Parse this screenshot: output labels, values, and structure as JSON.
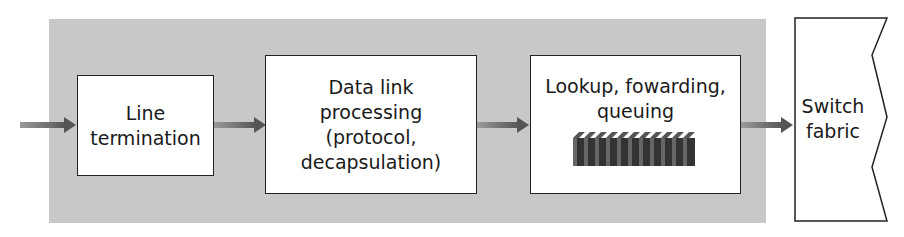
{
  "diagram": {
    "input_arrow": {
      "direction": "right"
    },
    "stages": [
      {
        "id": "line-termination",
        "lines": [
          "Line",
          "termination"
        ]
      },
      {
        "id": "data-link-processing",
        "lines": [
          "Data link",
          "processing",
          "(protocol,",
          "decapsulation)"
        ]
      },
      {
        "id": "lookup-forwarding-queuing",
        "lines": [
          "Lookup, fowarding,",
          "queuing"
        ],
        "icon": "queue-stack-icon"
      }
    ],
    "output": {
      "id": "switch-fabric",
      "lines": [
        "Switch",
        "fabric"
      ]
    },
    "colors": {
      "region": "#c8c8c8",
      "arrow": "#555555",
      "box_border": "#222222",
      "queue": "#444444"
    }
  }
}
